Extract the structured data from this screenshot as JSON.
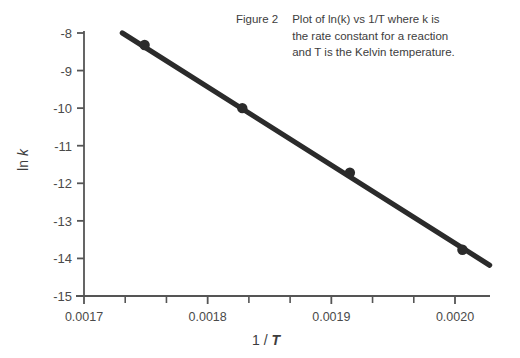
{
  "caption": {
    "figure_label": "Figure 2",
    "lines": [
      "Plot of ln(k) vs 1/T where k is",
      "the rate constant for a reaction",
      "and T is the Kelvin temperature."
    ]
  },
  "axis_titles": {
    "y_prefix": "ln ",
    "y_italic": "k",
    "x_prefix": "1 / ",
    "x_italic": "T"
  },
  "colors": {
    "line": "#2b2b2b",
    "axis": "#555555",
    "text": "#3d3d3d",
    "background": "#ffffff"
  },
  "chart_data": {
    "type": "scatter",
    "title": "",
    "subtitle": "",
    "xlabel": "1 / T",
    "ylabel": "ln k",
    "xlim": [
      0.0017,
      0.002
    ],
    "ylim": [
      -15,
      -8
    ],
    "grid": false,
    "legend": "none",
    "x_ticks": [
      0.0017,
      0.0018,
      0.0019,
      0.002
    ],
    "x_tick_labels": [
      "0.0017",
      "0.0018",
      "0.0019",
      "0.0020"
    ],
    "x_minor_ticks": [
      0.00173333,
      0.00176667,
      0.00183333,
      0.00186667,
      0.00193333,
      0.00196667
    ],
    "y_ticks": [
      -8,
      -9,
      -10,
      -11,
      -12,
      -13,
      -14,
      -15
    ],
    "y_tick_labels": [
      "-8",
      "-9",
      "-10",
      "-11",
      "-12",
      "-13",
      "-14",
      "-15"
    ],
    "x": [
      0.001749,
      0.001828,
      0.001915,
      0.002006
    ],
    "y": [
      -8.32,
      -10.0,
      -11.72,
      -13.77
    ],
    "series": [
      {
        "name": "ln(k) vs 1/T",
        "x": [
          0.001749,
          0.001828,
          0.001915,
          0.002006
        ],
        "y": [
          -8.32,
          -10.0,
          -11.72,
          -13.77
        ],
        "marker": "filled-circle",
        "line": "solid"
      }
    ],
    "fit_line": {
      "x_start": 0.001731,
      "y_start": -8.0,
      "x_end": 0.002028,
      "y_end": -14.18
    }
  }
}
